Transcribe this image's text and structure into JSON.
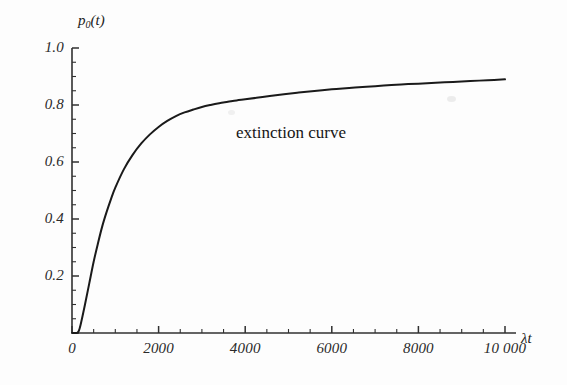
{
  "figure": {
    "background_color": "#fdfdfd",
    "ink_color": "#1a1a1a",
    "axis_color": "#3a3a3a"
  },
  "axes": {
    "y_axis_title": "p",
    "y_axis_title_sub": "0",
    "y_axis_title_tail": "(t)",
    "x_axis_title": "λt"
  },
  "annotations": [
    {
      "text": "extinction curve"
    }
  ],
  "chart_data": {
    "type": "line",
    "title": "",
    "subtitle": "",
    "xlabel": "λt",
    "ylabel": "p₀(t)",
    "xlim": [
      0,
      10000
    ],
    "ylim": [
      0,
      1.0
    ],
    "grid": false,
    "legend_position": "none",
    "x_ticks": [
      0,
      2000,
      4000,
      6000,
      8000,
      10000
    ],
    "x_tick_labels": [
      "0",
      "2000",
      "4000",
      "6000",
      "8000",
      "10 000"
    ],
    "x_minor_tick_step": 500,
    "y_ticks": [
      0,
      0.2,
      0.4,
      0.6,
      0.8,
      1.0
    ],
    "y_tick_labels": [
      "",
      "0.2",
      "0.4",
      "0.6",
      "0.8",
      "1.0"
    ],
    "y_minor_tick_step": 0.05,
    "series": [
      {
        "name": "extinction curve",
        "color": "#1a1a1a",
        "line_width": 2.0,
        "x": [
          0,
          100,
          150,
          200,
          300,
          400,
          500,
          600,
          700,
          800,
          900,
          1000,
          1200,
          1400,
          1600,
          1800,
          2000,
          2200,
          2400,
          2600,
          2800,
          3000,
          3200,
          3400,
          3600,
          3800,
          4000,
          4400,
          4800,
          5200,
          5600,
          6000,
          6400,
          6800,
          7200,
          7600,
          8000,
          8400,
          8800,
          9200,
          9600,
          10000
        ],
        "y": [
          0.0,
          0.0,
          0.005,
          0.03,
          0.1,
          0.175,
          0.25,
          0.315,
          0.375,
          0.425,
          0.47,
          0.51,
          0.575,
          0.625,
          0.665,
          0.697,
          0.723,
          0.744,
          0.761,
          0.774,
          0.784,
          0.793,
          0.8,
          0.806,
          0.811,
          0.816,
          0.82,
          0.828,
          0.836,
          0.843,
          0.849,
          0.855,
          0.86,
          0.864,
          0.868,
          0.872,
          0.875,
          0.878,
          0.881,
          0.884,
          0.887,
          0.89
        ]
      }
    ]
  }
}
